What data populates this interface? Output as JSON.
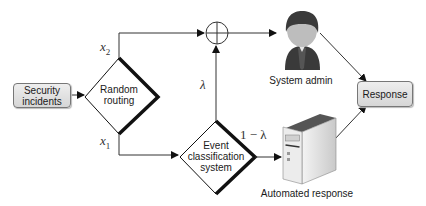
{
  "nodes": {
    "input": {
      "label_line1": "Security",
      "label_line2": "incidents"
    },
    "router": {
      "label_line1": "Random",
      "label_line2": "routing"
    },
    "classifier": {
      "label_line1": "Event",
      "label_line2": "classification",
      "label_line3": "system"
    },
    "combiner": {
      "symbol": "⊕"
    },
    "admin": {
      "label": "System admin",
      "icon": "person-icon"
    },
    "automated": {
      "label": "Automated response",
      "icon": "server-icon"
    },
    "output": {
      "label": "Response"
    }
  },
  "edges": {
    "x2": {
      "var": "x",
      "sub": "2"
    },
    "x1": {
      "var": "x",
      "sub": "1"
    },
    "lambda": {
      "label": "λ"
    },
    "one_minus_lambda": {
      "label": "1 − λ"
    }
  },
  "colors": {
    "line": "#333333",
    "box_fill_top": "#eeeeee",
    "box_fill_bottom": "#d6d6d6",
    "person": "#3a3a3a",
    "face": "#bdbdbd",
    "server": "#d8d8d8"
  }
}
